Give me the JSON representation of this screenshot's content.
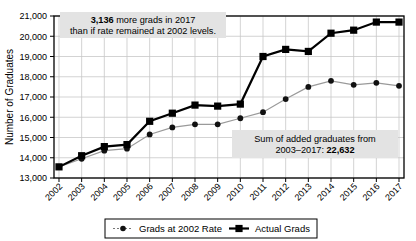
{
  "chart_data": {
    "type": "line",
    "title": "",
    "xlabel": "",
    "ylabel": "Number of Graduates",
    "ylim": [
      13000,
      21000
    ],
    "ytick_step": 1000,
    "yticks": [
      "13,000",
      "14,000",
      "15,000",
      "16,000",
      "17,000",
      "18,000",
      "19,000",
      "20,000",
      "21,000"
    ],
    "grid": true,
    "legend_position": "bottom",
    "categories": [
      "2002",
      "2003",
      "2004",
      "2005",
      "2006",
      "2007",
      "2008",
      "2009",
      "2010",
      "2011",
      "2012",
      "2013",
      "2014",
      "2015",
      "2016",
      "2017"
    ],
    "series": [
      {
        "name": "Grads at 2002 Rate",
        "marker": "circle",
        "line_style": "solid-light",
        "color": "#9a9a9a",
        "values": [
          13550,
          13950,
          14350,
          14450,
          15150,
          15500,
          15650,
          15650,
          15950,
          16250,
          16900,
          17500,
          17800,
          17600,
          17700,
          17550
        ]
      },
      {
        "name": "Actual Grads",
        "marker": "square",
        "line_style": "solid-bold",
        "color": "#000000",
        "values": [
          13550,
          14100,
          14550,
          14650,
          15800,
          16200,
          16600,
          16550,
          16650,
          19000,
          19350,
          19250,
          20150,
          20300,
          20700,
          20700
        ]
      }
    ],
    "trend_lines": [
      {
        "name": "upper-leader",
        "from": [
          2008.0,
          20800
        ],
        "to": [
          2017,
          20700
        ]
      },
      {
        "name": "lower-leader",
        "from": [
          2008.0,
          19750
        ],
        "to": [
          2017,
          17550
        ]
      }
    ],
    "annotations": [
      {
        "name": "top-annotation",
        "line1_bold": "3,136",
        "line1_rest": " more grads in 2017",
        "line2": "than if rate remained at 2002 levels."
      },
      {
        "name": "bottom-annotation",
        "line1": "Sum of added graduates from",
        "line2_rest": "2003–2017: ",
        "line2_bold": "22,632"
      }
    ]
  },
  "colors": {
    "grid": "#c8c8c8",
    "axis": "#000000",
    "annotation_bg": "#e3e3e3",
    "actual": "#000000",
    "rate2002": "#9a9a9a"
  }
}
